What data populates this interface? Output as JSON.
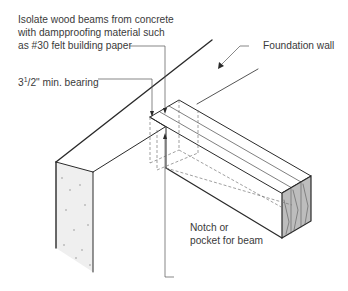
{
  "diagram": {
    "labels": {
      "isolate_line1": "Isolate wood beams from concrete",
      "isolate_line2": "with dampproofing material such",
      "isolate_line3": "as #30 felt building paper",
      "bearing_main": "3",
      "bearing_sup": "1",
      "bearing_rest": "/2\" min. bearing",
      "foundation": "Foundation wall",
      "notch_line1": "Notch or",
      "notch_line2": "pocket for beam"
    },
    "colors": {
      "line": "#2a2a2a",
      "concrete": "#eeeeee",
      "wood_end": "#b8b8b8",
      "text": "#3a3a3a"
    }
  }
}
